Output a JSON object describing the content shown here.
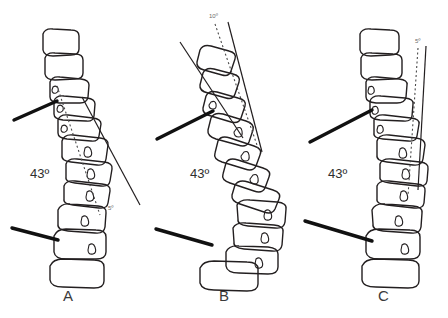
{
  "figure": {
    "title": "",
    "background_color": "#ffffff",
    "ink_color": "#231f20",
    "marker_color": "#1a1a1a",
    "panel_count": 3
  },
  "panels": [
    {
      "letter": "A",
      "cobb_angle_label": "43º",
      "tilt_angle_label": "5º",
      "cobb_angle_value": 43,
      "tilt_angle_value": 5,
      "vertebra_count": 12,
      "description": "spine-column-a"
    },
    {
      "letter": "B",
      "cobb_angle_label": "43º",
      "tilt_angle_label": "10º",
      "cobb_angle_value": 43,
      "tilt_angle_value": 10,
      "vertebra_count": 12,
      "description": "spine-column-b"
    },
    {
      "letter": "C",
      "cobb_angle_label": "43º",
      "tilt_angle_label": "5º",
      "cobb_angle_value": 43,
      "tilt_angle_value": 5,
      "vertebra_count": 12,
      "description": "spine-column-c"
    }
  ]
}
